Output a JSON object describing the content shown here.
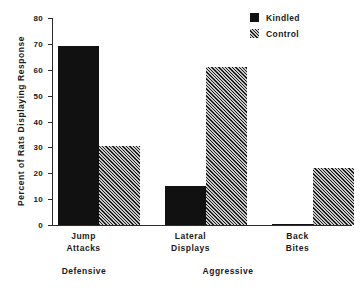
{
  "chart_data": {
    "type": "bar",
    "title": "",
    "xlabel": "",
    "ylabel": "Percent of Rats Displaying Response",
    "ylim": [
      0,
      80
    ],
    "yticks": [
      0,
      10,
      20,
      30,
      40,
      50,
      60,
      70,
      80
    ],
    "ytick_labels": [
      "0",
      "10",
      "20",
      "30",
      "40",
      "50",
      "60",
      "70",
      "80"
    ],
    "grid": false,
    "legend_position": "top-right",
    "categories": [
      "Jump\nAttacks",
      "Lateral\nDisplays",
      "Back\nBites"
    ],
    "category_lines": [
      [
        "Jump",
        "Attacks"
      ],
      [
        "Lateral",
        "Displays"
      ],
      [
        "Back",
        "Bites"
      ]
    ],
    "group_labels": [
      "Defensive",
      "Aggressive"
    ],
    "series": [
      {
        "name": "Kindled",
        "fill": "solid",
        "color": "#111111",
        "values": [
          69,
          15,
          0.5
        ]
      },
      {
        "name": "Control",
        "fill": "hatch",
        "color": "#6e6e6e",
        "values": [
          30.5,
          61,
          22
        ]
      }
    ]
  },
  "axis": {
    "y_title": "Percent of Rats Displaying Response",
    "ticks": [
      "80",
      "70",
      "60",
      "50",
      "40",
      "30",
      "20",
      "10",
      "0"
    ]
  },
  "legend": {
    "items": [
      {
        "label": "Kindled"
      },
      {
        "label": "Control"
      }
    ]
  },
  "categories": [
    {
      "line1": "Jump",
      "line2": "Attacks"
    },
    {
      "line1": "Lateral",
      "line2": "Displays"
    },
    {
      "line1": "Back",
      "line2": "Bites"
    }
  ],
  "groups": [
    {
      "label": "Defensive"
    },
    {
      "label": "Aggressive"
    }
  ]
}
